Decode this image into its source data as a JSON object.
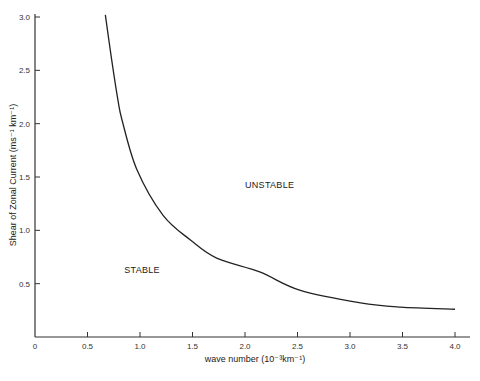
{
  "chart_data": {
    "type": "line",
    "title": "",
    "xlabel": "wave number",
    "xlabel_units": "(10⁻³km⁻¹)",
    "ylabel": "Shear of Zonal Current",
    "ylabel_units": "(ms⁻¹ km⁻¹)",
    "xlim": [
      0,
      4.0
    ],
    "ylim": [
      0,
      3.0
    ],
    "x_ticks": [
      "0",
      "0.5",
      "1.0",
      "1.5",
      "2.0",
      "2.5",
      "3.0",
      "3.5",
      "4.0"
    ],
    "y_ticks": [
      "0.5",
      "1.0",
      "1.5",
      "2.0",
      "2.5",
      "3.0"
    ],
    "grid": false,
    "series": [
      {
        "name": "stability boundary",
        "x": [
          0.67,
          0.73,
          0.79,
          0.83,
          0.97,
          1.22,
          1.48,
          1.73,
          2.14,
          2.52,
          3.1,
          3.48,
          4.0
        ],
        "y": [
          3.02,
          2.6,
          2.22,
          2.03,
          1.57,
          1.14,
          0.91,
          0.74,
          0.61,
          0.44,
          0.32,
          0.28,
          0.26
        ]
      }
    ],
    "annotations": [
      {
        "text": "UNSTABLE",
        "x": 2.0,
        "y": 1.4
      },
      {
        "text": "STABLE",
        "x": 0.85,
        "y": 0.6
      }
    ]
  }
}
